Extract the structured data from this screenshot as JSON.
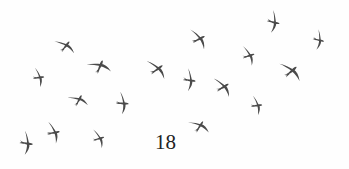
{
  "page": {
    "number": "18",
    "background": "#fefefe"
  },
  "illustration": {
    "subject": "flock of swifts in flight",
    "bird_icon": "swift-silhouette-icon",
    "bird_color": "#4a4a4a",
    "birds": [
      {
        "x": 40,
        "y": 77,
        "rot": 10,
        "scale": 0.85
      },
      {
        "x": 66,
        "y": 45,
        "rot": -35,
        "scale": 0.95
      },
      {
        "x": 100,
        "y": 65,
        "rot": -50,
        "scale": 1.05
      },
      {
        "x": 79,
        "y": 99,
        "rot": -45,
        "scale": 0.9
      },
      {
        "x": 124,
        "y": 103,
        "rot": 20,
        "scale": 0.95
      },
      {
        "x": 28,
        "y": 143,
        "rot": 25,
        "scale": 1.0
      },
      {
        "x": 55,
        "y": 132,
        "rot": 5,
        "scale": 0.95
      },
      {
        "x": 100,
        "y": 138,
        "rot": 0,
        "scale": 0.85
      },
      {
        "x": 158,
        "y": 68,
        "rot": -20,
        "scale": 1.05
      },
      {
        "x": 200,
        "y": 38,
        "rot": -10,
        "scale": 1.0
      },
      {
        "x": 191,
        "y": 80,
        "rot": 25,
        "scale": 0.95
      },
      {
        "x": 224,
        "y": 86,
        "rot": -15,
        "scale": 1.0
      },
      {
        "x": 250,
        "y": 55,
        "rot": 0,
        "scale": 0.9
      },
      {
        "x": 275,
        "y": 22,
        "rot": 30,
        "scale": 0.95
      },
      {
        "x": 292,
        "y": 70,
        "rot": -25,
        "scale": 1.1
      },
      {
        "x": 320,
        "y": 40,
        "rot": 30,
        "scale": 0.85
      },
      {
        "x": 258,
        "y": 105,
        "rot": 10,
        "scale": 0.85
      },
      {
        "x": 200,
        "y": 125,
        "rot": -40,
        "scale": 0.95
      }
    ]
  }
}
